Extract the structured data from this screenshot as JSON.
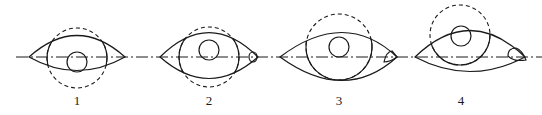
{
  "figure": {
    "centerline_y": 57,
    "colors": {
      "line": "#1a1a1a",
      "background": "#ffffff"
    },
    "eyes": [
      {
        "label": "1",
        "label_pos": [
          77,
          105
        ],
        "left_corner": [
          29,
          57
        ],
        "right_corner": [
          125,
          57
        ],
        "upper_lid_ctrl": [
          77,
          14
        ],
        "lower_lid_ctrl": [
          77,
          84
        ],
        "iris": {
          "cx": 77,
          "cy": 58,
          "r": 30,
          "hidden_part": "bottom (dashed below lower lid)"
        },
        "pupil": {
          "cx": 77,
          "cy": 62,
          "r": 10
        },
        "caruncle": null
      },
      {
        "label": "2",
        "label_pos": [
          209,
          105
        ],
        "left_corner": [
          160,
          57
        ],
        "right_corner": [
          258,
          57
        ],
        "upper_lid_ctrl": [
          209,
          8
        ],
        "lower_lid_ctrl": [
          209,
          100
        ],
        "iris": {
          "cx": 209,
          "cy": 57,
          "r": 30,
          "hidden_part": "top and bottom (dashed beyond lids)"
        },
        "pupil": {
          "cx": 209,
          "cy": 50,
          "r": 10
        },
        "caruncle": {
          "cx": 253,
          "cy": 57,
          "rx": 4,
          "ry": 5
        }
      },
      {
        "label": "3",
        "label_pos": [
          339,
          105
        ],
        "left_corner": [
          280,
          57
        ],
        "right_corner": [
          397,
          57
        ],
        "upper_lid_ctrl": [
          345,
          8
        ],
        "lower_lid_ctrl": [
          345,
          104
        ],
        "iris": {
          "cx": 339,
          "cy": 47,
          "r": 33,
          "hidden_part": "top (dashed above upper lid)"
        },
        "pupil": {
          "cx": 339,
          "cy": 47,
          "r": 10
        },
        "caruncle": {
          "cx": 390,
          "cy": 57,
          "rx": 6,
          "ry": 5
        }
      },
      {
        "label": "4",
        "label_pos": [
          461,
          105
        ],
        "left_corner": [
          415,
          57
        ],
        "right_corner": [
          525,
          57
        ],
        "upper_lid_ctrl": [
          470,
          4
        ],
        "lower_lid_ctrl": [
          470,
          86
        ],
        "iris": {
          "cx": 460,
          "cy": 35,
          "r": 30,
          "hidden_part": "top (dashed above upper lid)"
        },
        "pupil": {
          "cx": 461,
          "cy": 36,
          "r": 10
        },
        "caruncle": {
          "cx": 516,
          "cy": 56,
          "rx": 8,
          "ry": 6
        }
      }
    ]
  }
}
